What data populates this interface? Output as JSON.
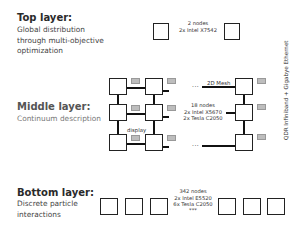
{
  "layers": {
    "top": {
      "title": "Top layer:",
      "description_lines": [
        "Global distribution",
        "through multi-objective",
        "optimization"
      ],
      "hardware": {
        "nodes": "2 nodes",
        "cpu": "2x Intel X7542"
      }
    },
    "middle": {
      "title": "Middle layer:",
      "description_lines": [
        "Continuum description"
      ],
      "hardware": {
        "nodes": "18 nodes",
        "cpu": "2x Intel X5670",
        "gpu": "2x Tesla C2050"
      },
      "mesh_label": "2D Mesh",
      "display_label": "display",
      "ellipsis": "..."
    },
    "bottom": {
      "title": "Bottom layer:",
      "description_lines": [
        "Discrete particle",
        "interactions"
      ],
      "hardware": {
        "nodes": "342 nodes",
        "cpu": "2x Intel E5520",
        "gpu": "6x Tesla C2050"
      },
      "ellipsis": "***"
    }
  },
  "interconnect_label": "QDR Infiniband + Gigabye Ethernet"
}
